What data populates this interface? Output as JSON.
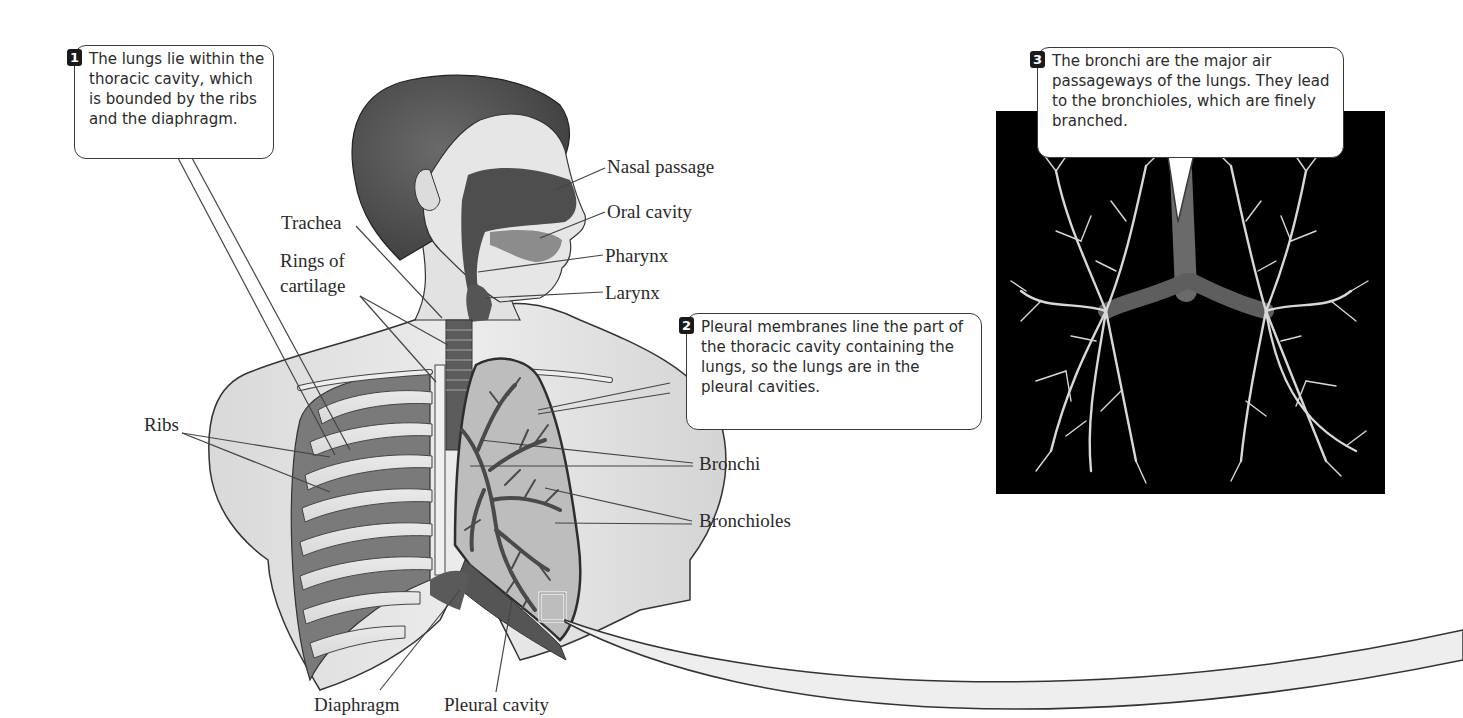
{
  "figure": {
    "colors": {
      "background": "#ffffff",
      "illustration_gray": "#8a8a8a",
      "dark_tissue": "#4a4a4a",
      "photo_bg": "#000000",
      "callout_border": "#3a3a3a",
      "number_badge": "#1a1a1a"
    }
  },
  "callouts": [
    {
      "number": "1",
      "text": "The lungs lie within the thoracic cavity, which is bounded by the ribs and the diaphragm."
    },
    {
      "number": "2",
      "text": "Pleural membranes line the part of the thoracic cavity containing the lungs, so the lungs are in the pleural cavities."
    },
    {
      "number": "3",
      "text": "The bronchi are the major air passageways of the lungs.  They lead to the bronchioles, which are finely branched."
    }
  ],
  "labels": {
    "nasal_passage": "Nasal passage",
    "oral_cavity": "Oral cavity",
    "pharynx": "Pharynx",
    "larynx": "Larynx",
    "trachea": "Trachea",
    "rings_of_cartilage_line1": "Rings of",
    "rings_of_cartilage_line2": "cartilage",
    "ribs": "Ribs",
    "bronchi": "Bronchi",
    "bronchioles": "Bronchioles",
    "diaphragm": "Diaphragm",
    "pleural_cavity": "Pleural cavity"
  },
  "photo": {
    "description": "Cast of bronchial tree showing finely branched bronchioles on black background"
  }
}
